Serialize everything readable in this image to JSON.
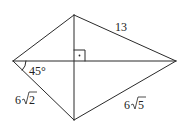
{
  "diagram": {
    "type": "kite-quadrilateral-with-diagonals",
    "vertices": {
      "left": [
        13,
        61
      ],
      "top": [
        74,
        15
      ],
      "right": [
        176,
        61
      ],
      "bottom": [
        74,
        120
      ]
    },
    "diagonal_intersection": [
      74,
      61
    ],
    "right_angle_marker": true,
    "labels": {
      "top_right_side": "13",
      "angle_left": "45°",
      "bottom_left_side": "6",
      "bottom_left_radicand": "2",
      "bottom_right_side": "6",
      "bottom_right_radicand": "5"
    },
    "stroke_color": "#2a2a2a",
    "background_color": "#ffffff"
  }
}
